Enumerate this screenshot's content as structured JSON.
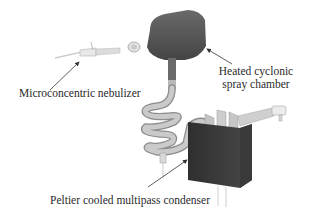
{
  "diagram": {
    "type": "apparatus-illustration",
    "components": [
      {
        "id": "nebulizer",
        "label": "Microconcentric nebulizer"
      },
      {
        "id": "spray-chamber",
        "label_lines": [
          "Heated cyclonic",
          "spray chamber"
        ]
      },
      {
        "id": "condenser",
        "label": "Peltier cooled multipass condenser"
      }
    ],
    "colors": {
      "chamber": "#555555",
      "condenser": "#3f3f3f",
      "tube": "#bdbdbd",
      "tube_shadow": "#8c8c8c",
      "fitting": "#e6e6e6",
      "arrow": "#333333",
      "text": "#2a2a2a"
    }
  },
  "labels": {
    "nebulizer": "Microconcentric nebulizer",
    "chamber_line1": "Heated cyclonic",
    "chamber_line2": "spray chamber",
    "condenser": "Peltier cooled multipass condenser"
  }
}
